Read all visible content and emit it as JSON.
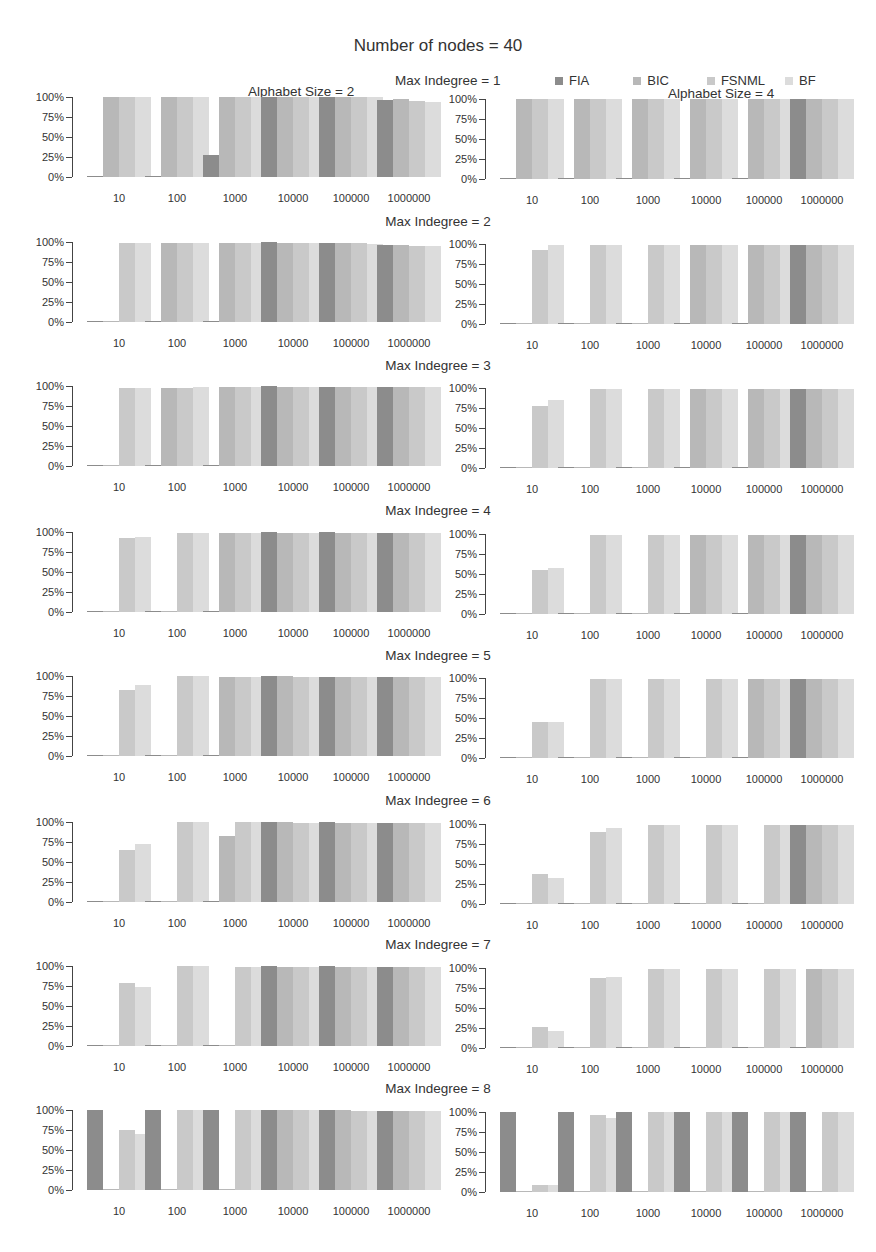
{
  "title": "Number of nodes = 40",
  "legend": [
    {
      "name": "FIA",
      "color": "#8c8c8c"
    },
    {
      "name": "BIC",
      "color": "#b8b8b8"
    },
    {
      "name": "FSNML",
      "color": "#c9c9c9"
    },
    {
      "name": "BF",
      "color": "#dcdcdc"
    }
  ],
  "panel_titles": [
    "Alphabet Size = 2",
    "Alphabet Size = 4"
  ],
  "yticks": [
    "100%",
    "75%",
    "50%",
    "25%",
    "0%"
  ],
  "chart_data": {
    "type": "bar",
    "title": "Number of nodes = 40",
    "categories": [
      "10",
      "100",
      "1000",
      "10000",
      "100000",
      "1000000"
    ],
    "series_names": [
      "FIA",
      "BIC",
      "FSNML",
      "BF"
    ],
    "ylim": [
      0,
      100
    ],
    "ylabel": "",
    "xlabel": "",
    "legend_position": "top-right",
    "grid": false,
    "rows": [
      {
        "title": "Max Indegree = 1",
        "alphabet_2": [
          [
            1,
            100,
            100,
            100
          ],
          [
            1,
            100,
            100,
            100
          ],
          [
            28,
            100,
            100,
            100
          ],
          [
            100,
            100,
            100,
            100
          ],
          [
            100,
            100,
            100,
            100
          ],
          [
            96,
            98,
            95,
            94
          ]
        ],
        "alphabet_4": [
          [
            1,
            100,
            100,
            100
          ],
          [
            1,
            100,
            100,
            100
          ],
          [
            1,
            100,
            100,
            100
          ],
          [
            1,
            100,
            100,
            100
          ],
          [
            1,
            100,
            100,
            100
          ],
          [
            100,
            100,
            100,
            100
          ]
        ]
      },
      {
        "title": "Max Indegree = 2",
        "alphabet_2": [
          [
            1,
            1,
            99,
            99
          ],
          [
            1,
            99,
            99,
            99
          ],
          [
            1,
            99,
            99,
            99
          ],
          [
            100,
            99,
            99,
            99
          ],
          [
            99,
            99,
            99,
            98
          ],
          [
            96,
            96,
            95,
            95
          ]
        ],
        "alphabet_4": [
          [
            1,
            1,
            93,
            99
          ],
          [
            1,
            1,
            99,
            99
          ],
          [
            1,
            1,
            99,
            99
          ],
          [
            1,
            99,
            99,
            99
          ],
          [
            1,
            99,
            99,
            99
          ],
          [
            99,
            99,
            99,
            99
          ]
        ]
      },
      {
        "title": "Max Indegree = 3",
        "alphabet_2": [
          [
            1,
            1,
            97,
            97
          ],
          [
            1,
            97,
            98,
            99
          ],
          [
            1,
            99,
            99,
            99
          ],
          [
            100,
            99,
            99,
            99
          ],
          [
            99,
            99,
            99,
            99
          ],
          [
            99,
            99,
            99,
            99
          ]
        ],
        "alphabet_4": [
          [
            1,
            1,
            77,
            85
          ],
          [
            1,
            1,
            99,
            99
          ],
          [
            1,
            1,
            99,
            99
          ],
          [
            1,
            99,
            99,
            99
          ],
          [
            1,
            99,
            99,
            99
          ],
          [
            99,
            99,
            99,
            99
          ]
        ]
      },
      {
        "title": "Max Indegree = 4",
        "alphabet_2": [
          [
            1,
            1,
            93,
            94
          ],
          [
            1,
            1,
            99,
            99
          ],
          [
            1,
            99,
            99,
            99
          ],
          [
            100,
            99,
            99,
            99
          ],
          [
            100,
            99,
            99,
            99
          ],
          [
            99,
            99,
            99,
            99
          ]
        ],
        "alphabet_4": [
          [
            1,
            1,
            55,
            58
          ],
          [
            1,
            1,
            99,
            99
          ],
          [
            1,
            1,
            99,
            99
          ],
          [
            1,
            99,
            99,
            99
          ],
          [
            1,
            99,
            99,
            99
          ],
          [
            99,
            99,
            99,
            99
          ]
        ]
      },
      {
        "title": "Max Indegree = 5",
        "alphabet_2": [
          [
            1,
            1,
            82,
            89
          ],
          [
            1,
            1,
            100,
            100
          ],
          [
            1,
            99,
            99,
            99
          ],
          [
            100,
            100,
            99,
            99
          ],
          [
            99,
            99,
            99,
            99
          ],
          [
            99,
            99,
            99,
            99
          ]
        ],
        "alphabet_4": [
          [
            1,
            1,
            45,
            45
          ],
          [
            1,
            1,
            99,
            99
          ],
          [
            1,
            1,
            99,
            99
          ],
          [
            1,
            1,
            99,
            99
          ],
          [
            1,
            99,
            99,
            99
          ],
          [
            99,
            99,
            99,
            99
          ]
        ]
      },
      {
        "title": "Max Indegree = 6",
        "alphabet_2": [
          [
            1,
            1,
            65,
            73
          ],
          [
            1,
            1,
            100,
            100
          ],
          [
            1,
            83,
            100,
            100
          ],
          [
            100,
            100,
            99,
            99
          ],
          [
            100,
            99,
            99,
            99
          ],
          [
            99,
            99,
            99,
            99
          ]
        ],
        "alphabet_4": [
          [
            1,
            1,
            38,
            33
          ],
          [
            1,
            1,
            90,
            95
          ],
          [
            1,
            1,
            99,
            99
          ],
          [
            1,
            1,
            99,
            99
          ],
          [
            1,
            1,
            99,
            99
          ],
          [
            99,
            99,
            99,
            99
          ]
        ]
      },
      {
        "title": "Max Indegree = 7",
        "alphabet_2": [
          [
            1,
            1,
            79,
            74
          ],
          [
            1,
            1,
            100,
            100
          ],
          [
            1,
            1,
            99,
            99
          ],
          [
            100,
            99,
            99,
            99
          ],
          [
            100,
            99,
            99,
            99
          ],
          [
            99,
            99,
            99,
            99
          ]
        ],
        "alphabet_4": [
          [
            1,
            1,
            26,
            21
          ],
          [
            1,
            1,
            87,
            89
          ],
          [
            1,
            1,
            99,
            99
          ],
          [
            1,
            1,
            99,
            99
          ],
          [
            1,
            1,
            99,
            99
          ],
          [
            1,
            99,
            99,
            99
          ]
        ]
      },
      {
        "title": "Max Indegree = 8",
        "alphabet_2": [
          [
            100,
            0,
            75,
            70
          ],
          [
            100,
            0,
            100,
            100
          ],
          [
            100,
            0,
            100,
            100
          ],
          [
            100,
            100,
            100,
            100
          ],
          [
            100,
            100,
            99,
            99
          ],
          [
            99,
            99,
            99,
            99
          ]
        ],
        "alphabet_4": [
          [
            100,
            0,
            9,
            9
          ],
          [
            100,
            0,
            96,
            93
          ],
          [
            100,
            0,
            100,
            100
          ],
          [
            100,
            0,
            100,
            100
          ],
          [
            100,
            0,
            100,
            100
          ],
          [
            100,
            0,
            100,
            100
          ]
        ]
      }
    ]
  }
}
